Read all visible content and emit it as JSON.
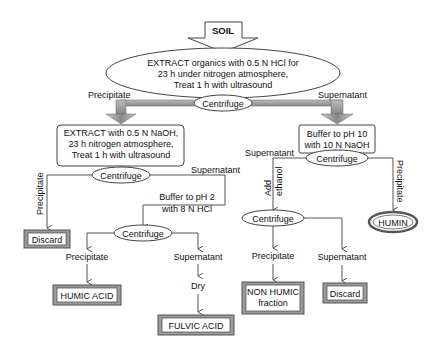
{
  "diagram": {
    "start": {
      "label": "SOIL"
    },
    "step1": {
      "lines": [
        "EXTRACT organics with 0.5 N HCl for",
        "23 h under nitrogen atmosphere,",
        "Treat  1 h with ultrasound"
      ]
    },
    "centrifuge_label": "Centrifuge",
    "branch_labels": {
      "precipitate": "Precipitate",
      "supernatant": "Supernatant",
      "dry": "Dry",
      "add_ethanol_1": "Add",
      "add_ethanol_2": "ethanol"
    },
    "left_extract": {
      "lines": [
        "EXTRACT with 0.5 N NaOH,",
        "23 h nitrogen atmosphere,",
        "Treat  1 h with ultrasound"
      ]
    },
    "buffer_ph2": {
      "lines": [
        "Buffer to pH 2",
        "with 8 N HCl"
      ]
    },
    "buffer_ph10": {
      "lines": [
        "Buffer to pH 10",
        "with 10 N NaOH"
      ]
    },
    "products": {
      "discard_left": "Discard",
      "humic_acid": "HUMIC ACID",
      "fulvic_acid": "FULVIC ACID",
      "non_humic_1": "NON HUMIC",
      "non_humic_2": "fraction",
      "discard_right": "Discard",
      "humin": "HUMIN"
    },
    "colors": {
      "arrow_fill": "#9a9a9a",
      "line": "#555555",
      "product_border": "#9a9a9a"
    }
  }
}
